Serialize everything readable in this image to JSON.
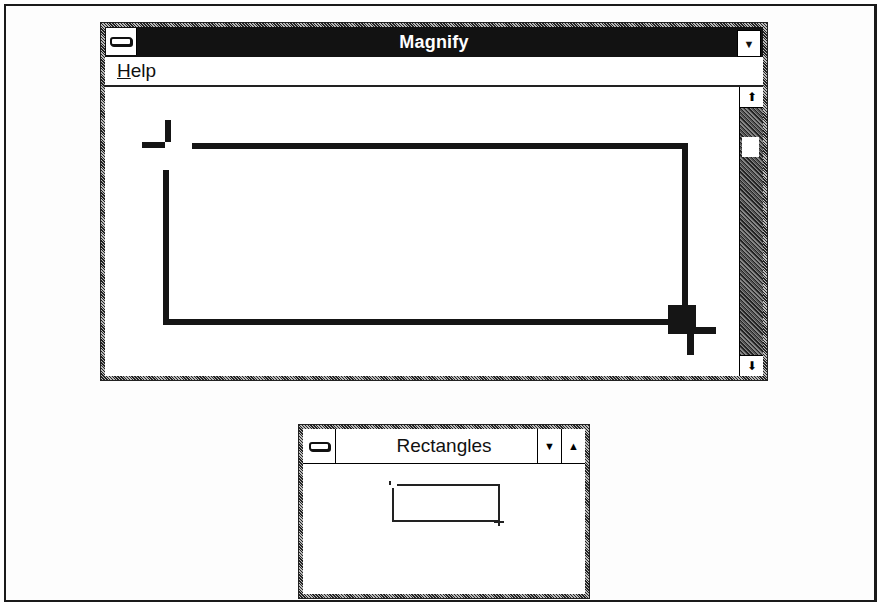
{
  "magnify_window": {
    "title": "Magnify",
    "system_menu_icon": "system-menu-icon",
    "minimize_icon": "▼",
    "menu": [
      {
        "label": "Help",
        "mnemonic": "H",
        "rest": "elp"
      }
    ],
    "scrollbar": {
      "up_icon": "🡅",
      "down_icon": "🡇"
    }
  },
  "rectangles_window": {
    "title": "Rectangles",
    "system_menu_icon": "system-menu-icon",
    "minimize_icon": "▼",
    "maximize_icon": "▲"
  },
  "colors": {
    "titlebar_active": "#121212",
    "window_bg": "#ffffff",
    "ink": "#151515"
  }
}
